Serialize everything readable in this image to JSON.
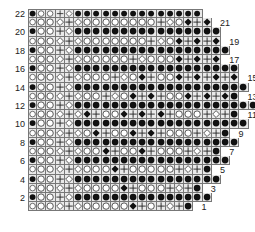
{
  "chart": {
    "type": "stitch-chart",
    "cell_px": 9.2,
    "origin_x": 28,
    "origin_y": 9,
    "left_labels": [
      "22",
      "20",
      "18",
      "16",
      "14",
      "12",
      "10",
      "8",
      "6",
      "4",
      "2"
    ],
    "right_labels": [
      "21",
      "19",
      "17",
      "15",
      "13",
      "11",
      "9",
      "7",
      "5",
      "3",
      "1"
    ],
    "legend_symbols": {
      "B": "filled-circle",
      "O": "open-circle",
      "D": "open-diamond",
      "K": "filled-diamond",
      "P": "plus",
      "E": "empty"
    },
    "rows": [
      {
        "num": "22",
        "side": "left",
        "cells": "BOOPDBBBBBBBBBBBBBB"
      },
      {
        "num": "21",
        "side": "right",
        "cells": "OOODPDOOOOOOOOPDOKPK"
      },
      {
        "num": "20",
        "side": "left",
        "cells": "BOOPDBBBBBBBBBBBBBBBB"
      },
      {
        "num": "19",
        "side": "right",
        "cells": "OOODPDOOOOOOOPDOKPKPK"
      },
      {
        "num": "18",
        "side": "left",
        "cells": "BOOPDBBBBBBBBBBBBBBBBB"
      },
      {
        "num": "17",
        "side": "right",
        "cells": "OOODPDOOOOOPDOOOKPKPK"
      },
      {
        "num": "16",
        "side": "left",
        "cells": "BOOPDBBBBBBBBBBBBBBBBBB"
      },
      {
        "num": "15",
        "side": "right",
        "cells": "OOODPDOOOPDOKPOOKPKPKPK"
      },
      {
        "num": "14",
        "side": "left",
        "cells": "BOOPDBBBBBBBBBBBBBBBBBBB"
      },
      {
        "num": "13",
        "side": "right",
        "cells": "OOODPDOOPDOKPKPOOKPKPKB"
      },
      {
        "num": "12",
        "side": "left",
        "cells": "BOOPDBBBBBBBBBBBBBBBBBBBB"
      },
      {
        "num": "11",
        "side": "right",
        "cells": "OOODPDKPOOKPKPKPOOOPDPB"
      },
      {
        "num": "10",
        "side": "left",
        "cells": "BOOPDBBBBBBBBBBBBBBBBBBB"
      },
      {
        "num": "9",
        "side": "right",
        "cells": "OOODPDOKPOOKPKPOOOPDPB"
      },
      {
        "num": "8",
        "side": "left",
        "cells": "BOOPDBBBBBBBBBBBBBBBBBB"
      },
      {
        "num": "7",
        "side": "right",
        "cells": "OOODPDOOKPOOKPOOOPDPB"
      },
      {
        "num": "6",
        "side": "left",
        "cells": "BOOPDBBBBBBBBBBBBBBBBB"
      },
      {
        "num": "5",
        "side": "right",
        "cells": "OOODPDOOOKPOOOOOPDPB"
      },
      {
        "num": "4",
        "side": "left",
        "cells": "BOOPDBBBBBBBBBBBBBBBB"
      },
      {
        "num": "3",
        "side": "right",
        "cells": "OOODPDOOOOKPOOOPDPB"
      },
      {
        "num": "2",
        "side": "left",
        "cells": "BOOPDBBBBBBBBBBBBBBB"
      },
      {
        "num": "1",
        "side": "right",
        "cells": "OOODPDOOOOOKPOPDPB"
      }
    ]
  }
}
